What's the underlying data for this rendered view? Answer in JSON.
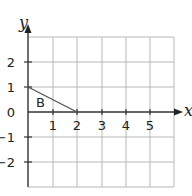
{
  "diagram": {
    "axis_labels": {
      "x": "x",
      "y": "y"
    },
    "x_ticks": [
      "1",
      "2",
      "3",
      "4",
      "5"
    ],
    "y_ticks": [
      "2",
      "1",
      "0",
      "−1",
      "−2"
    ],
    "region_label": "B",
    "grid": {
      "x_range": [
        0,
        6
      ],
      "y_range": [
        -3,
        3
      ]
    },
    "line_segment": {
      "from": [
        0,
        1
      ],
      "to": [
        2,
        0
      ]
    },
    "colors": {
      "grid": "#b8b8b8",
      "axis": "#333333",
      "segment": "#555555"
    }
  }
}
